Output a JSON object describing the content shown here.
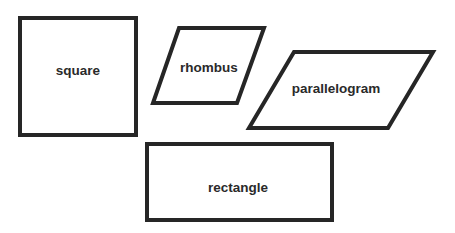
{
  "diagram": {
    "stroke_color": "#262626",
    "shapes": [
      {
        "id": "square",
        "label": "square",
        "points": "20,18 136,18 136,135 20,135",
        "label_x": 78,
        "label_y": 70
      },
      {
        "id": "rhombus",
        "label": "rhombus",
        "points": "179,28 264,28 237,103 153,103",
        "label_x": 209,
        "label_y": 67
      },
      {
        "id": "parallelogram",
        "label": "parallelogram",
        "points": "294,52 433,52 388,128 249,128",
        "label_x": 336,
        "label_y": 88
      },
      {
        "id": "rectangle",
        "label": "rectangle",
        "points": "147,144 332,144 332,220 147,220",
        "label_x": 238,
        "label_y": 187
      }
    ]
  }
}
